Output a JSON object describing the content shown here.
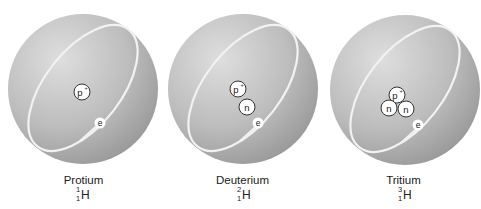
{
  "diagram": {
    "colors": {
      "sphere_light": "#dcdcdc",
      "sphere_dark": "#9c9c9c",
      "orbit": "#f2f2f2",
      "particle_fill": "#ffffff",
      "particle_stroke": "#333333",
      "text": "#222222"
    },
    "atoms": [
      {
        "name": "Protium",
        "element": "H",
        "mass_number": "1",
        "atomic_number": "1",
        "nucleus": [
          "p+"
        ],
        "electron": "e"
      },
      {
        "name": "Deuterium",
        "element": "H",
        "mass_number": "2",
        "atomic_number": "1",
        "nucleus": [
          "p+",
          "n"
        ],
        "electron": "e"
      },
      {
        "name": "Tritium",
        "element": "H",
        "mass_number": "3",
        "atomic_number": "1",
        "nucleus": [
          "p+",
          "n",
          "n"
        ],
        "electron": "e"
      }
    ],
    "particle_labels": {
      "proton": "p",
      "proton_charge": "+",
      "neutron": "n",
      "electron": "e"
    }
  }
}
